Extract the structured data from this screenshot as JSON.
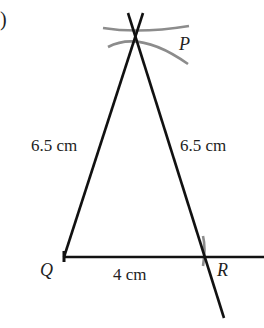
{
  "figure": {
    "part_label": ")",
    "points": {
      "P": {
        "label": "P",
        "x": 135,
        "y": 39
      },
      "Q": {
        "label": "Q",
        "x": 64,
        "y": 257
      },
      "R": {
        "label": "R",
        "x": 205,
        "y": 257
      }
    },
    "lengths": {
      "PQ": "6.5 cm",
      "PR": "6.5 cm",
      "QR": "4 cm"
    },
    "colors": {
      "line": "#111111",
      "arc": "#8c8c8c",
      "text": "#222222"
    }
  }
}
